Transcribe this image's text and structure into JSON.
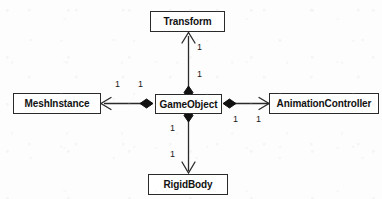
{
  "diagram": {
    "type": "uml-class-diagram",
    "background_color": "#fdfdfd",
    "node_fill": "#ffffff",
    "node_border_color": "#2a2a2a",
    "line_color": "#2a2a2a",
    "nodes": [
      {
        "id": "transform",
        "label": "Transform",
        "x": 150,
        "y": 11,
        "w": 75,
        "h": 21
      },
      {
        "id": "meshinstance",
        "label": "MeshInstance",
        "x": 13,
        "y": 93,
        "w": 88,
        "h": 21
      },
      {
        "id": "gameobject",
        "label": "GameObject",
        "x": 155,
        "y": 94,
        "w": 67,
        "h": 20
      },
      {
        "id": "animationcontroller",
        "label": "AnimationController",
        "x": 269,
        "y": 93,
        "w": 110,
        "h": 21
      },
      {
        "id": "rigidbody",
        "label": "RigidBody",
        "x": 148,
        "y": 174,
        "w": 80,
        "h": 21
      }
    ],
    "edges": [
      {
        "id": "gameobject-transform",
        "source": "gameobject",
        "target": "transform",
        "relation": "composition",
        "source_decoration": "filled-diamond",
        "target_decoration": "open-arrow",
        "source_multiplicity": "1",
        "target_multiplicity": "1"
      },
      {
        "id": "gameobject-meshinstance",
        "source": "gameobject",
        "target": "meshinstance",
        "relation": "composition",
        "source_decoration": "filled-diamond",
        "target_decoration": "open-arrow",
        "source_multiplicity": "1",
        "target_multiplicity": "1"
      },
      {
        "id": "gameobject-animationcontroller",
        "source": "gameobject",
        "target": "animationcontroller",
        "relation": "composition",
        "source_decoration": "filled-diamond",
        "target_decoration": "open-arrow",
        "source_multiplicity": "1",
        "target_multiplicity": "1"
      },
      {
        "id": "gameobject-rigidbody",
        "source": "gameobject",
        "target": "rigidbody",
        "relation": "composition",
        "source_decoration": "filled-diamond",
        "target_decoration": "open-arrow",
        "source_multiplicity": "1",
        "target_multiplicity": "1"
      }
    ],
    "multiplicity_labels": [
      {
        "id": "mult-transform-near",
        "text": "1",
        "x": 197,
        "y": 43
      },
      {
        "id": "mult-transform-far",
        "text": "1",
        "x": 197,
        "y": 70
      },
      {
        "id": "mult-mesh-far",
        "text": "1",
        "x": 115,
        "y": 80
      },
      {
        "id": "mult-mesh-near",
        "text": "1",
        "x": 138,
        "y": 80
      },
      {
        "id": "mult-anim-near",
        "text": "1",
        "x": 233,
        "y": 115
      },
      {
        "id": "mult-anim-far",
        "text": "1",
        "x": 256,
        "y": 115
      },
      {
        "id": "mult-rigid-near",
        "text": "1",
        "x": 170,
        "y": 124
      },
      {
        "id": "mult-rigid-far",
        "text": "1",
        "x": 170,
        "y": 150
      }
    ]
  }
}
